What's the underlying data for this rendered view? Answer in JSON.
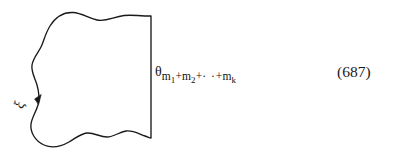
{
  "figure": {
    "background_color": "#ffffff",
    "ink_color": "#1a1a1a",
    "contour": {
      "name": "closed-contour-region",
      "description": "wavy closed curve with straight vertical right edge",
      "orientation_marker": "downward arrowhead on left branch"
    },
    "curve_label": {
      "symbol": "ξ",
      "rotation_degrees": -72
    },
    "boundary_label": {
      "base_symbol": "θ",
      "subscript_terms": [
        "m",
        "1",
        "+",
        "m",
        "2",
        "+",
        "· ·",
        "+",
        "m",
        "k"
      ],
      "subscript_plain": "m1+m2+· ·+mk",
      "parts": {
        "theta": "θ",
        "m_first": "m",
        "index_first": "1",
        "plus_one": "+",
        "m_second": "m",
        "index_second": "2",
        "plus_two": "+",
        "ellipsis": "· ·",
        "plus_three": "+",
        "m_last": "m",
        "index_last": "k"
      }
    },
    "equation_number": "(687)"
  }
}
